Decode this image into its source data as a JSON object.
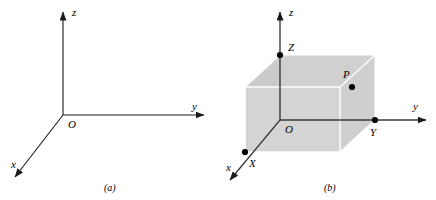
{
  "figure": {
    "background_color": "#ffffff",
    "width": 436,
    "height": 200,
    "line_color": "#1a1a1a",
    "panels": [
      {
        "id": "panel-a",
        "caption": "(a)",
        "caption_x": 110,
        "caption_y": 190,
        "description": "Right-handed three dimensional Cartesian coordinate axes",
        "origin": {
          "label": "O",
          "x": 63,
          "y": 115,
          "label_x": 68,
          "label_y": 127
        },
        "axes": [
          {
            "name": "z-axis",
            "label": "z",
            "from_x": 63,
            "from_y": 115,
            "to_x": 63,
            "to_y": 10,
            "label_x": 72,
            "label_y": 13,
            "arrow": true
          },
          {
            "name": "y-axis",
            "label": "y",
            "from_x": 63,
            "from_y": 115,
            "to_x": 206,
            "to_y": 115,
            "label_x": 192,
            "label_y": 110,
            "arrow": true
          },
          {
            "name": "x-axis",
            "label": "x",
            "from_x": 63,
            "from_y": 115,
            "to_x": 13,
            "to_y": 180,
            "label_x": 12,
            "label_y": 167,
            "arrow": true
          }
        ]
      },
      {
        "id": "panel-b",
        "caption": "(b)",
        "caption_x": 330,
        "caption_y": 190,
        "description": "Point P located by a rectangular box with projections X, Y and Z on the axes",
        "origin": {
          "label": "O",
          "x": 280,
          "y": 120,
          "label_x": 285,
          "label_y": 132
        },
        "axes": [
          {
            "name": "z-axis",
            "label": "z",
            "from_x": 280,
            "from_y": 120,
            "to_x": 280,
            "to_y": 10,
            "label_x": 289,
            "label_y": 13,
            "arrow": true
          },
          {
            "name": "y-axis",
            "label": "y",
            "from_x": 280,
            "from_y": 120,
            "to_x": 428,
            "to_y": 120,
            "label_x": 414,
            "label_y": 110,
            "arrow": true
          },
          {
            "name": "x-axis",
            "label": "x",
            "from_x": 280,
            "from_y": 120,
            "to_x": 228,
            "to_y": 183,
            "label_x": 227,
            "label_y": 170,
            "arrow": true
          }
        ],
        "box": {
          "name": "rectangular-box",
          "face_fill_front": "#d2d2d2",
          "face_fill_top": "#d0d0d0",
          "face_fill_left": "#cccccc",
          "hidden_edge_color": "#ffffff",
          "outline_color": "#a8a8a8",
          "vertices": {
            "origin_corner": {
              "x": 280,
              "y": 120
            },
            "x_corner": {
              "x": 245,
              "y": 152
            },
            "y_corner": {
              "x": 375,
              "y": 120
            },
            "z_corner": {
              "x": 280,
              "y": 55
            },
            "front_bottom_right": {
              "x": 340,
              "y": 152
            },
            "front_top_left": {
              "x": 245,
              "y": 87
            },
            "front_top_right": {
              "x": 340,
              "y": 87
            },
            "back_top_right": {
              "x": 375,
              "y": 55
            }
          }
        },
        "points": [
          {
            "name": "point-P",
            "label": "P",
            "x": 352,
            "y": 87,
            "label_x": 344,
            "label_y": 77
          },
          {
            "name": "point-X",
            "label": "X",
            "x": 245,
            "y": 152,
            "label_x": 250,
            "label_y": 166
          },
          {
            "name": "point-Y",
            "label": "Y",
            "x": 375,
            "y": 120,
            "label_x": 371,
            "label_y": 135
          },
          {
            "name": "point-Z",
            "label": "Z",
            "x": 280,
            "y": 55,
            "label_x": 288,
            "label_y": 50
          }
        ]
      }
    ]
  }
}
